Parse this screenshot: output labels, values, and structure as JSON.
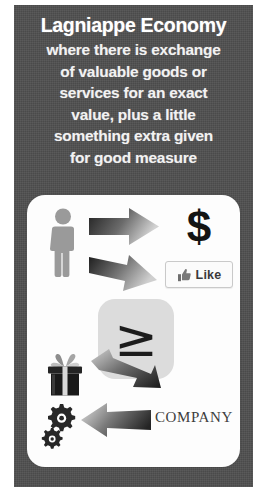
{
  "card": {
    "background_color": "#4f4f4f",
    "panel_color": "#fdfdfd"
  },
  "headline": {
    "title": "Lagniappe Economy",
    "subtitle": "where there is exchange\nof valuable goods or\nservices for an exact\nvalue, plus a little\nsomething extra given\nfor good measure"
  },
  "diagram": {
    "nodes": [
      {
        "id": "person",
        "icon": "person-icon",
        "label": ""
      },
      {
        "id": "dollar",
        "icon": "dollar-sign-icon",
        "label": "$"
      },
      {
        "id": "like",
        "icon": "thumbs-up-icon",
        "label": "Like"
      },
      {
        "id": "center",
        "icon": "greater-than-or-equal-icon",
        "label": "≥"
      },
      {
        "id": "gift",
        "icon": "gift-box-icon",
        "label": ""
      },
      {
        "id": "gears",
        "icon": "gears-icon",
        "label": ""
      },
      {
        "id": "company",
        "icon": "",
        "label": "COMPANY"
      }
    ],
    "arrows": [
      {
        "id": "arrow-right-top",
        "direction": "right"
      },
      {
        "id": "arrow-right-bottom",
        "direction": "right"
      },
      {
        "id": "arrow-left-top",
        "direction": "left"
      },
      {
        "id": "arrow-left-bottom",
        "direction": "left"
      }
    ],
    "center_symbol": "≥",
    "like_label": "Like",
    "dollar_label": "$",
    "company_label": "COMPANY"
  },
  "colors": {
    "frame": "#4f4f4f",
    "panel": "#fdfdfd",
    "icon_gray": "#9a9a9a",
    "arrow_dark": "#2b2b2b",
    "arrow_light": "#b9b9b9",
    "center_box": "#dcdcdc",
    "text_light": "#ffffff"
  }
}
